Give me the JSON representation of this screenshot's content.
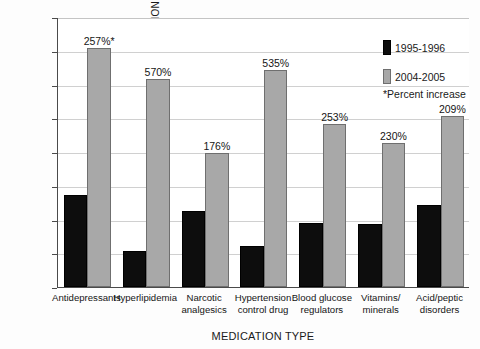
{
  "chart_data": {
    "type": "bar",
    "title": "",
    "xlabel": "MEDICATION TYPE",
    "ylabel": "VISITS WITH AT LEAST ONE DRUG PER 100 POPULATION",
    "ylim": [
      0,
      40
    ],
    "yticks": [
      0,
      5,
      10,
      15,
      20,
      25,
      30,
      35,
      40
    ],
    "grid": true,
    "legend_position": "top-right",
    "categories": [
      "Antidepressants",
      "Hyperlipidemia",
      "Narcotic analgesics",
      "Hypertension control drug",
      "Blood glucose regulators",
      "Vitamins/ minerals",
      "Acid/peptic disorders"
    ],
    "category_lines": [
      [
        "Antidepressants"
      ],
      [
        "Hyperlipidemia"
      ],
      [
        "Narcotic",
        "analgesics"
      ],
      [
        "Hypertension",
        "control drug"
      ],
      [
        "Blood glucose",
        "regulators"
      ],
      [
        "Vitamins/",
        "minerals"
      ],
      [
        "Acid/peptic",
        "disorders"
      ]
    ],
    "series": [
      {
        "name": "1995-1996",
        "color": "#0d0d0d",
        "values": [
          13.7,
          5.3,
          11.2,
          6.1,
          9.5,
          9.3,
          12.2
        ]
      },
      {
        "name": "2004-2005",
        "color": "#a8a8a8",
        "values": [
          35.4,
          30.8,
          19.8,
          32.1,
          24.2,
          21.4,
          25.4
        ]
      }
    ],
    "annotations": [
      "257%*",
      "570%",
      "176%",
      "535%",
      "253%",
      "230%",
      "209%"
    ],
    "footnote": "*Percent increase"
  },
  "legend": {
    "items": [
      {
        "label": "1995-1996",
        "style": "dark"
      },
      {
        "label": "2004-2005",
        "style": "light"
      }
    ],
    "note": "*Percent increase"
  }
}
